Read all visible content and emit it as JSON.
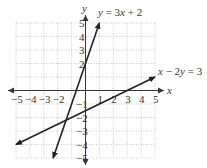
{
  "chart_data": {
    "type": "line",
    "title": "",
    "xlabel": "x",
    "ylabel": "y",
    "xlim": [
      -5,
      5
    ],
    "ylim": [
      -5,
      5
    ],
    "grid": true,
    "x_ticks": [
      "−5",
      "−4",
      "−3",
      "−2",
      "1",
      "2",
      "3",
      "4",
      "5"
    ],
    "y_ticks": [
      "5",
      "4",
      "3",
      "2",
      "−1",
      "−2",
      "−3",
      "−4",
      "−5"
    ],
    "series": [
      {
        "name": "y = 3x + 2",
        "equation": "y = 3x + 2",
        "points": [
          [
            -2.33,
            -5
          ],
          [
            1,
            5
          ]
        ],
        "intercepts": {
          "y": 2,
          "x": -0.67
        }
      },
      {
        "name": "x − 2y = 3",
        "equation": "x − 2y = 3",
        "points": [
          [
            -5,
            -4
          ],
          [
            5,
            1
          ]
        ],
        "intercepts": {
          "y": -1.5,
          "x": 3
        }
      }
    ],
    "intersection": [
      -1.4,
      -2.2
    ],
    "annotations": [
      {
        "text": "y = 3x + 2",
        "position": "top, near line end"
      },
      {
        "text": "x − 2y = 3",
        "position": "right, near line end"
      }
    ]
  },
  "labels": {
    "x_axis": "x",
    "y_axis": "y",
    "line1": {
      "y": "y",
      "rest": " = 3",
      "x": "x",
      "tail": " + 2"
    },
    "line2": {
      "x": "x",
      "mid": " − 2",
      "y": "y",
      "tail": " = 3"
    }
  },
  "colors": {
    "grid": "#bbbbbb",
    "axis": "#333333",
    "line": "#222222"
  }
}
